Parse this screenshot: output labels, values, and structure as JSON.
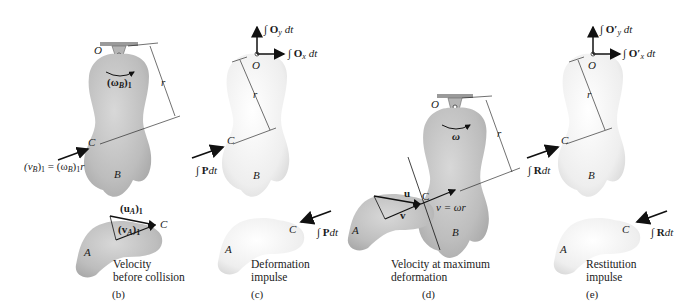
{
  "figures": {
    "b": {
      "id": "(b)",
      "caption_line1": "Velocity",
      "caption_line2": "before collision",
      "pivot_label": "O",
      "omega_label": "(ω",
      "omega_sub": "B",
      "omega_close": ")",
      "omega_sub2": "1",
      "r_label": "r",
      "contact_label": "C",
      "body_b_label": "B",
      "body_a_label": "A",
      "vb_eq": "(v",
      "vb_sub": "B",
      "vb_mid": ")",
      "vb_sub1": "1",
      "vb_rhs": " = (ω",
      "vb_rhs_sub": "B",
      "vb_rhs_close": ")",
      "vb_rhs_sub1": "1",
      "vb_r": "r",
      "ua_label": "(u",
      "ua_sub": "A",
      "ua_close": ")",
      "ua_sub1": "1",
      "va_label": "(v",
      "va_sub": "A",
      "va_close": ")",
      "va_sub1": "1",
      "a_contact_label": "C"
    },
    "c": {
      "id": "(c)",
      "caption_line1": "Deformation",
      "caption_line2": "impulse",
      "pivot_label": "O",
      "oy_label": "∫ O",
      "oy_sub": "y",
      "oy_dt": " dt",
      "ox_label": "∫ O",
      "ox_sub": "x",
      "ox_dt": " dt",
      "r_label": "r",
      "contact_label": "C",
      "body_b_label": "B",
      "body_a_label": "A",
      "impulse_b": "∫ P",
      "impulse_b_dt": "dt",
      "impulse_a": "∫ P",
      "impulse_a_dt": "dt",
      "a_contact_label": "C"
    },
    "d": {
      "id": "(d)",
      "caption_line1": "Velocity at maximum",
      "caption_line2": "deformation",
      "pivot_label": "O",
      "omega_label": "ω",
      "r_label": "r",
      "contact_label": "C",
      "u_label": "u",
      "v_label": "v",
      "speed_eq": "v = ωr",
      "body_b_label": "B",
      "body_a_label": "A"
    },
    "e": {
      "id": "(e)",
      "caption_line1": "Restitution",
      "caption_line2": "impulse",
      "pivot_label": "O",
      "oy_label": "∫ O′",
      "oy_sub": "y",
      "oy_dt": " dt",
      "ox_label": "∫ O′",
      "ox_sub": "x",
      "ox_dt": " dt",
      "r_label": "r",
      "contact_label": "C",
      "body_b_label": "B",
      "body_a_label": "A",
      "impulse_b": "∫ R",
      "impulse_b_dt": "dt",
      "impulse_a": "∫ R",
      "impulse_a_dt": "dt",
      "a_contact_label": "C"
    }
  },
  "colors": {
    "body_shaded": "#c9c9c9",
    "body_light": "#f3f3f3",
    "stroke": "#1a1a1a",
    "support": "#8a8a8a"
  }
}
